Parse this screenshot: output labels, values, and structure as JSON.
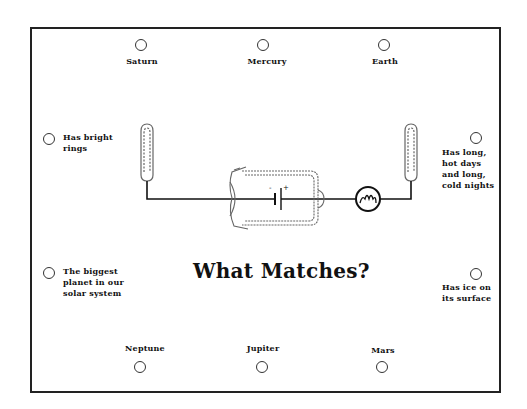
{
  "title": "What Matches?",
  "planets": {
    "top": [
      {
        "label": "Saturn"
      },
      {
        "label": "Mercury"
      },
      {
        "label": "Earth"
      }
    ],
    "bottom": [
      {
        "label": "Neptune"
      },
      {
        "label": "Jupiter"
      },
      {
        "label": "Mars"
      }
    ]
  },
  "descriptions": {
    "left": [
      {
        "lines": [
          "Has bright",
          "rings"
        ]
      },
      {
        "lines": [
          "The biggest",
          "planet in our",
          "solar system"
        ]
      }
    ],
    "right": [
      {
        "lines": [
          "Has long,",
          "hot days",
          "and long,",
          "cold nights"
        ]
      },
      {
        "lines": [
          "Has ice on",
          "its surface"
        ]
      }
    ]
  },
  "circuit": {
    "battery_minus": "-",
    "battery_plus": "+",
    "components": [
      "left-clip-probe",
      "battery-holder",
      "light-bulb",
      "right-clip-probe"
    ]
  }
}
